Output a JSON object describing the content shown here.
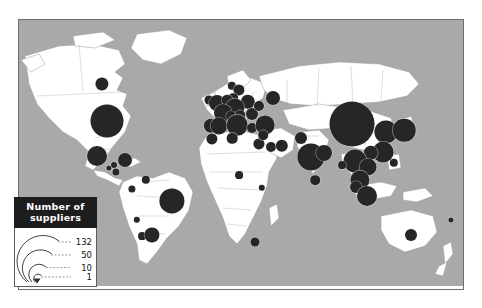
{
  "figure": {
    "type": "proportional-symbol-map",
    "projection": "world-equirectangular",
    "symbol_color": "#262626",
    "ocean_color": "#a9a9a9",
    "land_color": "#ffffff",
    "border_color": "#9a9a9a"
  },
  "legend": {
    "title_line1": "Number  of",
    "title_line2": "suppliers",
    "header_bg": "#1d1d1d",
    "header_text_color": "#ffffff",
    "breaks": [
      {
        "label": "132",
        "value": 132
      },
      {
        "label": "50",
        "value": 50
      },
      {
        "label": "10",
        "value": 10
      },
      {
        "label": "1",
        "value": 1
      }
    ]
  },
  "chart_data": {
    "type": "scatter",
    "title": "Number of suppliers",
    "xlabel": "Longitude",
    "ylabel": "Latitude",
    "size_legend_values": [
      132,
      50,
      10,
      1
    ],
    "size_encoding": "area-proportional",
    "points": [
      {
        "name": "Canada",
        "value": 14,
        "x": 83,
        "y": 64,
        "r": 6.6
      },
      {
        "name": "United States",
        "value": 88,
        "x": 88,
        "y": 101,
        "r": 16.5
      },
      {
        "name": "Mexico",
        "value": 31,
        "x": 78,
        "y": 136,
        "r": 10.0
      },
      {
        "name": "Guatemala",
        "value": 2,
        "x": 90,
        "y": 148,
        "r": 2.6
      },
      {
        "name": "Honduras",
        "value": 3,
        "x": 95,
        "y": 145,
        "r": 3.0
      },
      {
        "name": "Costa Rica",
        "value": 5,
        "x": 97,
        "y": 152,
        "r": 3.6
      },
      {
        "name": "Caribbean",
        "value": 16,
        "x": 106,
        "y": 140,
        "r": 7.0
      },
      {
        "name": "Colombia",
        "value": 5,
        "x": 113,
        "y": 169,
        "r": 3.6
      },
      {
        "name": "Venezuela",
        "value": 7,
        "x": 127,
        "y": 160,
        "r": 4.2
      },
      {
        "name": "Peru",
        "value": 4,
        "x": 118,
        "y": 200,
        "r": 3.2
      },
      {
        "name": "Brazil",
        "value": 52,
        "x": 153,
        "y": 181,
        "r": 12.6
      },
      {
        "name": "Chile",
        "value": 6,
        "x": 123,
        "y": 216,
        "r": 3.9
      },
      {
        "name": "Argentina",
        "value": 20,
        "x": 133,
        "y": 215,
        "r": 7.6
      },
      {
        "name": "Ireland",
        "value": 8,
        "x": 190,
        "y": 80,
        "r": 4.5
      },
      {
        "name": "United Kingdom",
        "value": 22,
        "x": 198,
        "y": 83,
        "r": 8.0
      },
      {
        "name": "Norway",
        "value": 7,
        "x": 213,
        "y": 66,
        "r": 4.2
      },
      {
        "name": "Sweden",
        "value": 12,
        "x": 220,
        "y": 70,
        "r": 5.6
      },
      {
        "name": "Denmark",
        "value": 9,
        "x": 214,
        "y": 78,
        "r": 4.8
      },
      {
        "name": "Poland",
        "value": 18,
        "x": 229,
        "y": 82,
        "r": 7.2
      },
      {
        "name": "Netherlands",
        "value": 11,
        "x": 208,
        "y": 80,
        "r": 5.3
      },
      {
        "name": "Germany",
        "value": 30,
        "x": 216,
        "y": 88,
        "r": 9.6
      },
      {
        "name": "France",
        "value": 26,
        "x": 204,
        "y": 93,
        "r": 9.0
      },
      {
        "name": "Switzerland",
        "value": 10,
        "x": 212,
        "y": 96,
        "r": 5.0
      },
      {
        "name": "Austria",
        "value": 9,
        "x": 221,
        "y": 95,
        "r": 4.8
      },
      {
        "name": "Romania",
        "value": 13,
        "x": 233,
        "y": 94,
        "r": 6.0
      },
      {
        "name": "Ukraine",
        "value": 10,
        "x": 240,
        "y": 86,
        "r": 5.0
      },
      {
        "name": "Russia",
        "value": 16,
        "x": 254,
        "y": 78,
        "r": 7.0
      },
      {
        "name": "Portugal",
        "value": 17,
        "x": 192,
        "y": 106,
        "r": 7.2
      },
      {
        "name": "Spain",
        "value": 24,
        "x": 200,
        "y": 106,
        "r": 8.5
      },
      {
        "name": "Italy",
        "value": 33,
        "x": 218,
        "y": 105,
        "r": 10.3
      },
      {
        "name": "Greece",
        "value": 10,
        "x": 233,
        "y": 108,
        "r": 5.0
      },
      {
        "name": "Turkey",
        "value": 29,
        "x": 246,
        "y": 105,
        "r": 9.4
      },
      {
        "name": "Morocco",
        "value": 12,
        "x": 193,
        "y": 119,
        "r": 5.6
      },
      {
        "name": "Tunisia",
        "value": 11,
        "x": 213,
        "y": 118,
        "r": 5.3
      },
      {
        "name": "Egypt",
        "value": 12,
        "x": 240,
        "y": 124,
        "r": 5.6
      },
      {
        "name": "Israel",
        "value": 9,
        "x": 244,
        "y": 115,
        "r": 4.8
      },
      {
        "name": "Saudi Arabia",
        "value": 10,
        "x": 252,
        "y": 127,
        "r": 5.0
      },
      {
        "name": "UAE",
        "value": 14,
        "x": 263,
        "y": 126,
        "r": 6.2
      },
      {
        "name": "Nigeria",
        "value": 6,
        "x": 220,
        "y": 155,
        "r": 3.9
      },
      {
        "name": "Kenya",
        "value": 4,
        "x": 243,
        "y": 168,
        "r": 3.2
      },
      {
        "name": "South Africa",
        "value": 8,
        "x": 236,
        "y": 222,
        "r": 4.5
      },
      {
        "name": "Pakistan",
        "value": 13,
        "x": 282,
        "y": 118,
        "r": 6.0
      },
      {
        "name": "India",
        "value": 64,
        "x": 292,
        "y": 137,
        "r": 13.6
      },
      {
        "name": "Sri Lanka",
        "value": 9,
        "x": 296,
        "y": 160,
        "r": 4.8
      },
      {
        "name": "Bangladesh",
        "value": 22,
        "x": 305,
        "y": 133,
        "r": 8.0
      },
      {
        "name": "China",
        "value": 132,
        "x": 333,
        "y": 104,
        "r": 22.5
      },
      {
        "name": "South Korea",
        "value": 44,
        "x": 367,
        "y": 112,
        "r": 11.6
      },
      {
        "name": "Japan",
        "value": 42,
        "x": 385,
        "y": 110,
        "r": 11.3
      },
      {
        "name": "Taiwan",
        "value": 34,
        "x": 364,
        "y": 132,
        "r": 10.4
      },
      {
        "name": "Hong Kong",
        "value": 17,
        "x": 352,
        "y": 133,
        "r": 7.2
      },
      {
        "name": "Philippines",
        "value": 7,
        "x": 375,
        "y": 143,
        "r": 4.2
      },
      {
        "name": "Thailand",
        "value": 43,
        "x": 336,
        "y": 141,
        "r": 11.4
      },
      {
        "name": "Vietnam",
        "value": 24,
        "x": 349,
        "y": 147,
        "r": 8.5
      },
      {
        "name": "Myanmar",
        "value": 6,
        "x": 323,
        "y": 145,
        "r": 3.9
      },
      {
        "name": "Malaysia",
        "value": 30,
        "x": 341,
        "y": 160,
        "r": 9.6
      },
      {
        "name": "Singapore",
        "value": 13,
        "x": 337,
        "y": 167,
        "r": 6.0
      },
      {
        "name": "Indonesia",
        "value": 32,
        "x": 348,
        "y": 176,
        "r": 10.0
      },
      {
        "name": "Australia",
        "value": 13,
        "x": 392,
        "y": 215,
        "r": 6.0
      },
      {
        "name": "Pacific",
        "value": 2,
        "x": 432,
        "y": 200,
        "r": 2.6
      }
    ]
  }
}
